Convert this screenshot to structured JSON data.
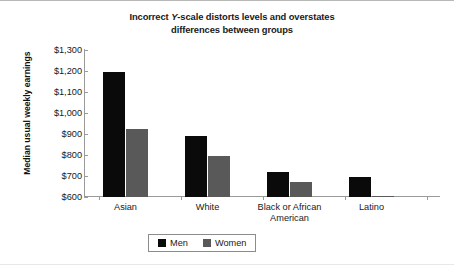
{
  "chart_data": {
    "type": "bar",
    "title_line1_prefix": "Incorrect ",
    "title_line1_italic": "Y",
    "title_line1_suffix": "-scale distorts levels and overstates",
    "title_line2": "differences between groups",
    "title": "Incorrect Y-scale distorts levels and overstates differences between groups",
    "xlabel": "",
    "ylabel": "Median usual weekly earnings",
    "ylim": [
      600,
      1300
    ],
    "ytick_step": 100,
    "ytick_labels": [
      "$1,300",
      "$1,200",
      "$1,100",
      "$1,000",
      "$900",
      "$800",
      "$700",
      "$600"
    ],
    "ytick_values": [
      1300,
      1200,
      1100,
      1000,
      900,
      800,
      700,
      600
    ],
    "grid": false,
    "legend_position": "bottom-center",
    "categories": [
      "Asian",
      "White",
      "Black or African American",
      "Latino"
    ],
    "category_lines": [
      [
        "Asian"
      ],
      [
        "White"
      ],
      [
        "Black or African",
        "American"
      ],
      [
        "Latino"
      ]
    ],
    "series": [
      {
        "name": "Men",
        "color": "#0a0a0a",
        "values": [
          1195,
          890,
          720,
          695
        ]
      },
      {
        "name": "Women",
        "color": "#595959",
        "values": [
          925,
          795,
          670,
          605
        ]
      }
    ]
  },
  "colors": {
    "men": "#0a0a0a",
    "women": "#595959",
    "axis": "#9a9a9a",
    "text": "#202020",
    "frame_top": "#b8b8b8"
  }
}
